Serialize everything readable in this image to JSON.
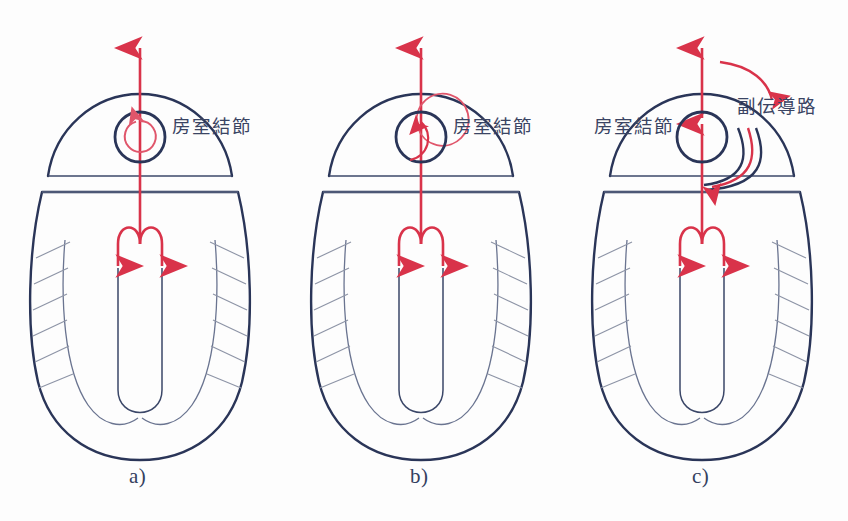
{
  "figure": {
    "width": 848,
    "height": 521,
    "background_color": "#fdfdfd"
  },
  "colors": {
    "outline_navy": "#2a3558",
    "arrow_red": "#d9334a",
    "loop_red": "#e0566b",
    "hatch_gray": "#8d94a6",
    "septum_navy": "#3b4768",
    "caption_navy": "#34405f",
    "label_navy": "#3a4463"
  },
  "panels": [
    {
      "id": "panel-a",
      "caption": "a)",
      "caption_x": 137,
      "caption_y": 466,
      "center_x": 140,
      "av_node": {
        "label": "房室結節",
        "label_x": 172,
        "label_y": 122,
        "label_side": "right",
        "loop_style": "inside-node",
        "loop_description": "small red circular arrow drawn inside the AV node circle"
      },
      "accessory_pathway": null
    },
    {
      "id": "panel-b",
      "caption": "b)",
      "caption_x": 418,
      "caption_y": 466,
      "center_x": 421,
      "av_node": {
        "label": "房室結節",
        "label_x": 453,
        "label_y": 122,
        "label_side": "right",
        "loop_style": "offset-left",
        "loop_description": "larger red circular arrow offset to the left, overlapping the AV node circle"
      },
      "accessory_pathway": null
    },
    {
      "id": "panel-c",
      "caption": "c)",
      "caption_x": 700,
      "caption_y": 466,
      "center_x": 702,
      "av_node": {
        "label": "房室結節",
        "label_x": 594,
        "label_y": 122,
        "label_side": "left",
        "loop_style": "none",
        "loop_description": "no re-entry loop inside the node"
      },
      "accessory_pathway": {
        "label": "副伝導路",
        "label_x": 737,
        "label_y": 100,
        "description": "navy bypass tract curving around the right side of the AV node, carrying a red downward arrow; a red arc sweeps clockwise across the top of the atrium"
      }
    }
  ],
  "anatomy": {
    "atrium_name": "atrium-dome",
    "ventricle_name": "ventricle-body",
    "septum_name": "interventricular-septum",
    "bundle_name": "bundle-branch-fork",
    "hatch_name": "myocardial-striations",
    "main_arrow_up_name": "retrograde-conduction-arrow",
    "main_arrow_down_name": "antegrade-conduction-arrow"
  }
}
